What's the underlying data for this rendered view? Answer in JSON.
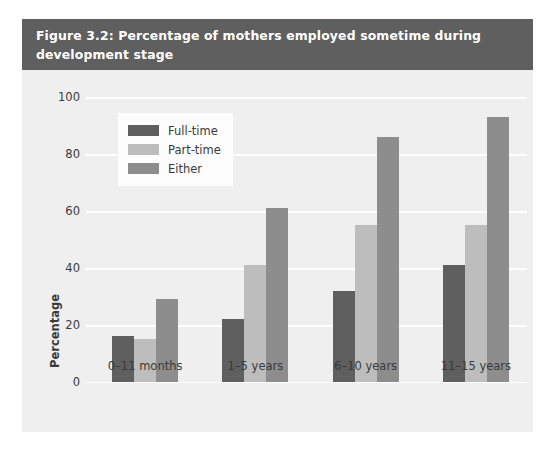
{
  "figure": {
    "title": "Figure 3.2: Percentage of mothers employed sometime during\ndevelopment stage"
  },
  "colors": {
    "full_time": "#5f5f5f",
    "part_time": "#bdbdbd",
    "either": "#8d8d8d",
    "title_band": "#5f5f5f",
    "panel_background": "#efefef",
    "gridline": "#ffffff",
    "text": "#3a3a3a"
  },
  "legend": {
    "position": "upper-left-inside",
    "entries": [
      {
        "label": "Full-time",
        "swatch": "#5f5f5f"
      },
      {
        "label": "Part-time",
        "swatch": "#bdbdbd"
      },
      {
        "label": "Either",
        "swatch": "#8d8d8d"
      }
    ]
  },
  "chart_data": {
    "type": "bar",
    "title": "Figure 3.2: Percentage of mothers employed sometime during development stage",
    "xlabel": "Development stage",
    "ylabel": "Percentage",
    "categories": [
      "0–11 months",
      "1–5 years",
      "6–10 years",
      "11–15 years"
    ],
    "series": [
      {
        "name": "Full-time",
        "values": [
          16,
          22,
          32,
          41
        ]
      },
      {
        "name": "Part-time",
        "values": [
          15,
          41,
          55,
          55
        ]
      },
      {
        "name": "Either",
        "values": [
          29,
          61,
          86,
          93
        ]
      }
    ],
    "ylim": [
      0,
      100
    ],
    "yticks": [
      0,
      20,
      40,
      60,
      80,
      100
    ],
    "ytick_labels": [
      "0",
      "20",
      "40",
      "60",
      "80",
      "100"
    ],
    "grid": "horizontal",
    "legend_position": "upper left"
  }
}
